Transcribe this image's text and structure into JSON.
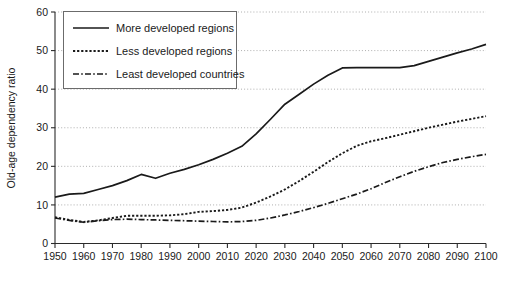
{
  "chart_data": {
    "type": "line",
    "title": "",
    "xlabel": "",
    "ylabel": "Old-age dependency ratio",
    "xlim": [
      1950,
      2100
    ],
    "ylim": [
      0,
      60
    ],
    "grid": true,
    "legend_position": "top-left",
    "xticks": [
      1950,
      1960,
      1970,
      1980,
      1990,
      2000,
      2010,
      2020,
      2030,
      2040,
      2050,
      2060,
      2070,
      2080,
      2090,
      2100
    ],
    "yticks": [
      0,
      10,
      20,
      30,
      40,
      50,
      60
    ],
    "x": [
      1950,
      1955,
      1960,
      1965,
      1970,
      1975,
      1980,
      1985,
      1990,
      1995,
      2000,
      2005,
      2010,
      2015,
      2020,
      2025,
      2030,
      2035,
      2040,
      2045,
      2050,
      2055,
      2060,
      2065,
      2070,
      2075,
      2080,
      2085,
      2090,
      2095,
      2100
    ],
    "series": [
      {
        "name": "More developed regions",
        "style": "solid",
        "values": [
          12.0,
          12.8,
          13.0,
          14.0,
          15.0,
          16.3,
          17.9,
          16.9,
          18.2,
          19.2,
          20.4,
          21.8,
          23.4,
          25.2,
          28.4,
          32.2,
          36.1,
          38.7,
          41.3,
          43.6,
          45.5,
          45.6,
          45.6,
          45.6,
          45.6,
          46.1,
          47.2,
          48.3,
          49.4,
          50.4,
          51.6
        ]
      },
      {
        "name": "Less developed regions",
        "style": "dotted",
        "values": [
          6.8,
          6.1,
          5.6,
          6.0,
          6.6,
          7.2,
          7.2,
          7.2,
          7.3,
          7.6,
          8.2,
          8.4,
          8.7,
          9.3,
          10.6,
          12.2,
          14.0,
          16.2,
          18.6,
          21.1,
          23.4,
          25.3,
          26.5,
          27.3,
          28.2,
          29.1,
          30.0,
          30.8,
          31.6,
          32.3,
          33.0
        ]
      },
      {
        "name": "Least developed countries",
        "style": "dashdot",
        "values": [
          6.6,
          6.0,
          5.5,
          5.9,
          6.2,
          6.3,
          6.2,
          6.1,
          6.0,
          5.9,
          5.8,
          5.7,
          5.6,
          5.7,
          6.0,
          6.6,
          7.4,
          8.3,
          9.3,
          10.4,
          11.6,
          12.8,
          14.2,
          15.8,
          17.3,
          18.7,
          19.9,
          21.0,
          21.8,
          22.5,
          23.1
        ]
      }
    ]
  },
  "legend": {
    "items": [
      {
        "label": "More developed regions",
        "sample": "solid-line-sample"
      },
      {
        "label": "Less developed regions",
        "sample": "dotted-line-sample"
      },
      {
        "label": "Least developed countries",
        "sample": "dashdot-line-sample"
      }
    ]
  },
  "axes": {
    "y_title": "Old-age dependency ratio",
    "y_tick_labels": [
      "0",
      "10",
      "20",
      "30",
      "40",
      "50",
      "60"
    ],
    "x_tick_labels": [
      "1950",
      "1960",
      "1970",
      "1980",
      "1990",
      "2000",
      "2010",
      "2020",
      "2030",
      "2040",
      "2050",
      "2060",
      "2070",
      "2080",
      "2090",
      "2100"
    ]
  }
}
